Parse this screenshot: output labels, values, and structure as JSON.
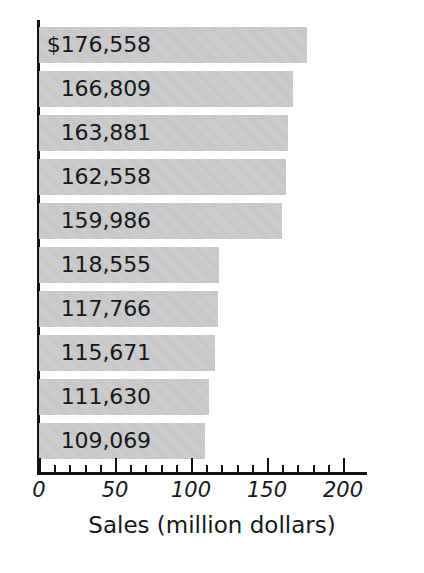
{
  "chart_data": {
    "type": "bar",
    "orientation": "horizontal",
    "title": "",
    "xlabel": "Sales (million dollars)",
    "ylabel": "",
    "xlim": [
      0,
      220
    ],
    "grid": false,
    "legend": null,
    "categories": [
      "",
      "",
      "",
      "",
      "",
      "",
      "",
      "",
      "",
      ""
    ],
    "values": [
      176.558,
      166.809,
      163.881,
      162.558,
      159.986,
      118.555,
      117.766,
      115.671,
      111.63,
      109.069
    ],
    "data_labels": [
      "$176,558",
      "166,809",
      "163,881",
      "162,558",
      "159,986",
      "118,555",
      "117,766",
      "115,671",
      "111,630",
      "109,069"
    ],
    "x_ticks_major": [
      0,
      50,
      100,
      150,
      200
    ],
    "x_tick_labels": [
      "0",
      "50",
      "100",
      "150",
      "200"
    ],
    "x_ticks_minor_step": 10,
    "bar_color": "#c6c6c6",
    "axis_color": "#131313",
    "text_color": "#17181a",
    "note": "Values are stated in thousands of dollars in the data labels; axis is scaled in millions of dollars."
  }
}
